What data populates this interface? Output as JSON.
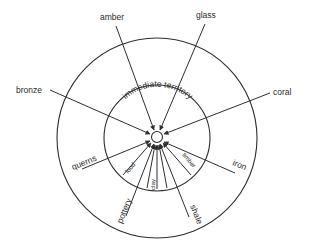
{
  "diagram": {
    "type": "concentric-resource-catchment",
    "center_label": "",
    "rings": [
      {
        "name": "immediate-territory",
        "label": "immediate territory"
      },
      {
        "name": "outer-region",
        "label": ""
      }
    ],
    "outer_resources": [
      {
        "label": "amber"
      },
      {
        "label": "glass"
      },
      {
        "label": "bronze"
      },
      {
        "label": "coral"
      },
      {
        "label": "querns"
      },
      {
        "label": "iron"
      },
      {
        "label": "pottery"
      },
      {
        "label": "shale"
      }
    ],
    "local_resources": [
      {
        "label": "food"
      },
      {
        "label": "clay"
      },
      {
        "label": "timber"
      }
    ],
    "colors": {
      "stroke": "#2e2e2e",
      "text": "#2a2a2a",
      "background": "#ffffff"
    }
  }
}
